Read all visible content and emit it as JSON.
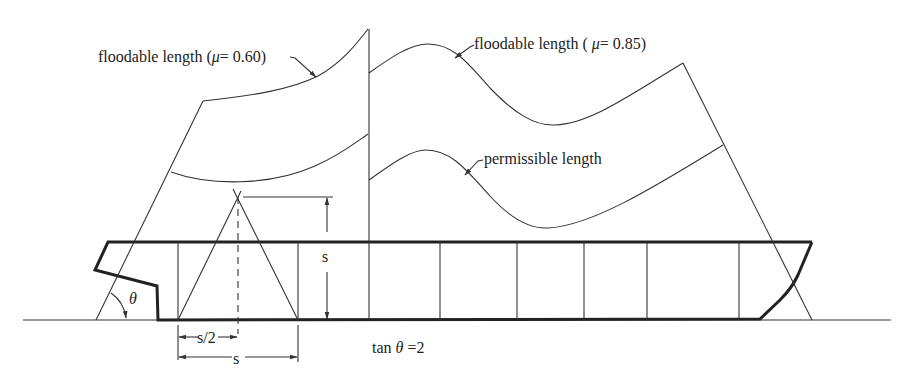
{
  "labels": {
    "floodable_060": "floodable length (",
    "mu1": "μ",
    "floodable_060_tail": "= 0.60)",
    "floodable_085": "floodable length ( ",
    "mu2": "μ",
    "floodable_085_tail": "= 0.85)",
    "permissible": "permissible length",
    "theta": "θ",
    "s_vertical": "s",
    "s_half": "s/2",
    "s_base": "s",
    "tan_prefix": "tan ",
    "tan_theta": "θ",
    "tan_suffix": " =2"
  },
  "colors": {
    "line": "#333333",
    "hull": "#222222",
    "background": "#ffffff"
  }
}
